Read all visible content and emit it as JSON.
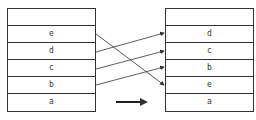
{
  "left_stack": {
    "cells": [
      "",
      "e",
      "d",
      "c",
      "b",
      "a"
    ]
  },
  "right_stack": {
    "cells": [
      "",
      "d",
      "c",
      "b",
      "e",
      "a"
    ]
  },
  "colors": {
    "line": "#333333"
  }
}
